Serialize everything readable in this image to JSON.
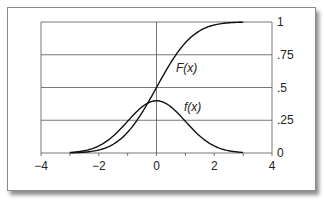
{
  "chart_data": {
    "type": "line",
    "title": "",
    "xlabel": "",
    "ylabel": "",
    "xlim": [
      -4,
      4
    ],
    "ylim": [
      0,
      1
    ],
    "x_ticks": [
      "−4",
      "−2",
      "0",
      "2",
      "4"
    ],
    "y_ticks": [
      "0",
      ".25",
      ".5",
      ".75",
      "1"
    ],
    "y_axis_position": "right",
    "grid": {
      "horizontal": true,
      "vertical_at_zero": true
    },
    "series": [
      {
        "name": "F(x)",
        "label": "F(x)",
        "description": "standard normal cumulative distribution",
        "x": [
          -3,
          -2.5,
          -2,
          -1.5,
          -1,
          -0.5,
          0,
          0.5,
          1,
          1.5,
          2,
          2.5,
          3
        ],
        "values": [
          0.001,
          0.006,
          0.023,
          0.067,
          0.159,
          0.309,
          0.5,
          0.691,
          0.841,
          0.933,
          0.977,
          0.994,
          0.999
        ]
      },
      {
        "name": "f(x)",
        "label": "f(x)",
        "description": "standard normal probability density",
        "x": [
          -3,
          -2.5,
          -2,
          -1.5,
          -1,
          -0.5,
          0,
          0.5,
          1,
          1.5,
          2,
          2.5,
          3
        ],
        "values": [
          0.004,
          0.018,
          0.054,
          0.13,
          0.242,
          0.352,
          0.399,
          0.352,
          0.242,
          0.13,
          0.054,
          0.018,
          0.004
        ]
      }
    ]
  },
  "labels": {
    "F": "F(x)",
    "f": "f(x)"
  }
}
